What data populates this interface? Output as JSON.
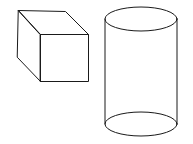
{
  "figure": {
    "background": "#ffffff",
    "stroke_color": "#1a1a1a",
    "shapes": [
      {
        "name": "cube",
        "type": "wireframe-cube",
        "front_face": {
          "x1": 40,
          "y1": 34,
          "x2": 88,
          "y2": 81
        },
        "back_top_left": [
          18,
          10
        ],
        "back_top_right": [
          65,
          11
        ],
        "back_bottom_left": [
          17,
          57
        ]
      },
      {
        "name": "cylinder",
        "type": "wireframe-cylinder",
        "cx": 141,
        "top_cy": 19,
        "bottom_cy": 124,
        "rx": 36,
        "ry": 12
      }
    ]
  }
}
